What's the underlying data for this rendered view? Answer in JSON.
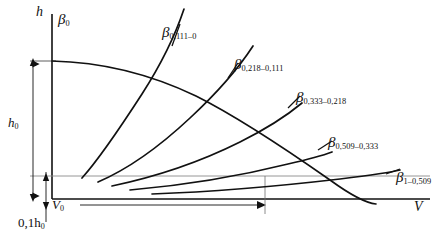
{
  "figure": {
    "axes": {
      "y_label": "h",
      "x_label": "V",
      "y_axis_name": "vertical-axis",
      "x_axis_name": "horizontal-axis"
    },
    "dimensions": {
      "h0_label": "h",
      "h0_sub": "0",
      "tenth_h0_label": "0,1h",
      "tenth_h0_sub": "0",
      "v0_label": "V",
      "v0_sub": "0"
    },
    "curve_labels": [
      {
        "base": "β",
        "sub": "0",
        "name": "curve-label-beta-0"
      },
      {
        "base": "β",
        "sub": "0,111–0",
        "name": "curve-label-beta-0111-0"
      },
      {
        "base": "β",
        "sub": "0,218–0,111",
        "name": "curve-label-beta-0218-0111"
      },
      {
        "base": "β",
        "sub": "0,333–0,218",
        "name": "curve-label-beta-0333-0218"
      },
      {
        "base": "β",
        "sub": "0,509–0,333",
        "name": "curve-label-beta-0509-0333"
      },
      {
        "base": "β",
        "sub": "1–0,509",
        "name": "curve-label-beta-1-0509"
      }
    ]
  },
  "chart_data": {
    "type": "line",
    "title": "",
    "xlabel": "V",
    "ylabel": "h",
    "grid": false,
    "legend_position": "inline-curve-labels",
    "axis_origin_px": [
      52,
      199
    ],
    "xlim_px": [
      52,
      430
    ],
    "ylim_px": [
      199,
      14
    ],
    "reference_lines": [
      {
        "name": "h0-level-line",
        "y_value": "h_0",
        "y_px": 61,
        "style": "thin-solid",
        "from_px": [
          33,
          61
        ],
        "to_px": [
          52,
          61
        ]
      },
      {
        "name": "tenth-h0-level-line",
        "y_value": "0,1 h_0",
        "y_px": 176,
        "style": "thin-grey",
        "from_px": [
          52,
          176
        ],
        "to_px": [
          430,
          176
        ]
      }
    ],
    "series": [
      {
        "name": "β 0",
        "label_sub": "0",
        "description": "descending envelope curve from h_0 at the vertical axis, bending down to the right",
        "points_px": [
          [
            52,
            61
          ],
          [
            90,
            62
          ],
          [
            130,
            68
          ],
          [
            170,
            78
          ],
          [
            210,
            92
          ],
          [
            250,
            110
          ],
          [
            290,
            131
          ],
          [
            320,
            150
          ],
          [
            345,
            167
          ],
          [
            362,
            182
          ],
          [
            372,
            196
          ],
          [
            375,
            203
          ]
        ]
      },
      {
        "name": "β 0,111–0",
        "label_sub": "0,111–0",
        "description": "steep rising curve, concave up, starting near 0,1 h_0",
        "points_px": [
          [
            82,
            178
          ],
          [
            96,
            160
          ],
          [
            110,
            140
          ],
          [
            124,
            118
          ],
          [
            140,
            92
          ],
          [
            155,
            66
          ],
          [
            168,
            42
          ],
          [
            178,
            22
          ],
          [
            183,
            10
          ]
        ]
      },
      {
        "name": "β 0,218–0,111",
        "label_sub": "0,218–0,111",
        "description": "rising curve, less steep, starting near 0,1 h_0",
        "points_px": [
          [
            98,
            182
          ],
          [
            124,
            168
          ],
          [
            150,
            150
          ],
          [
            176,
            128
          ],
          [
            202,
            103
          ],
          [
            224,
            80
          ],
          [
            240,
            62
          ],
          [
            252,
            48
          ]
        ]
      },
      {
        "name": "β 0,333–0,218",
        "label_sub": "0,333–0,218",
        "description": "rising nearly straight curve, moderate slope",
        "points_px": [
          [
            112,
            186
          ],
          [
            148,
            176
          ],
          [
            184,
            162
          ],
          [
            220,
            146
          ],
          [
            256,
            128
          ],
          [
            285,
            112
          ],
          [
            300,
            103
          ]
        ]
      },
      {
        "name": "β 0,509–0,333",
        "label_sub": "0,509–0,333",
        "description": "gently rising line",
        "points_px": [
          [
            130,
            190
          ],
          [
            180,
            184
          ],
          [
            230,
            176
          ],
          [
            280,
            166
          ],
          [
            320,
            156
          ],
          [
            330,
            153
          ]
        ]
      },
      {
        "name": "β 1–0,509",
        "label_sub": "1–0,509",
        "description": "shallowest rising line, nearly horizontal",
        "points_px": [
          [
            150,
            194
          ],
          [
            220,
            190
          ],
          [
            290,
            184
          ],
          [
            350,
            177
          ],
          [
            395,
            170
          ],
          [
            400,
            169
          ]
        ]
      }
    ],
    "annotations": [
      {
        "text": "h₀",
        "type": "dimension",
        "orientation": "vertical",
        "span_px": [
          [
            33,
            61
          ],
          [
            33,
            199
          ]
        ]
      },
      {
        "text": "0,1h₀",
        "type": "dimension",
        "orientation": "vertical",
        "span_px": [
          [
            46,
            176
          ],
          [
            46,
            199
          ]
        ]
      },
      {
        "text": "V₀",
        "type": "dimension",
        "orientation": "horizontal",
        "span_px": [
          [
            52,
            205
          ],
          [
            265,
            205
          ]
        ]
      }
    ]
  }
}
